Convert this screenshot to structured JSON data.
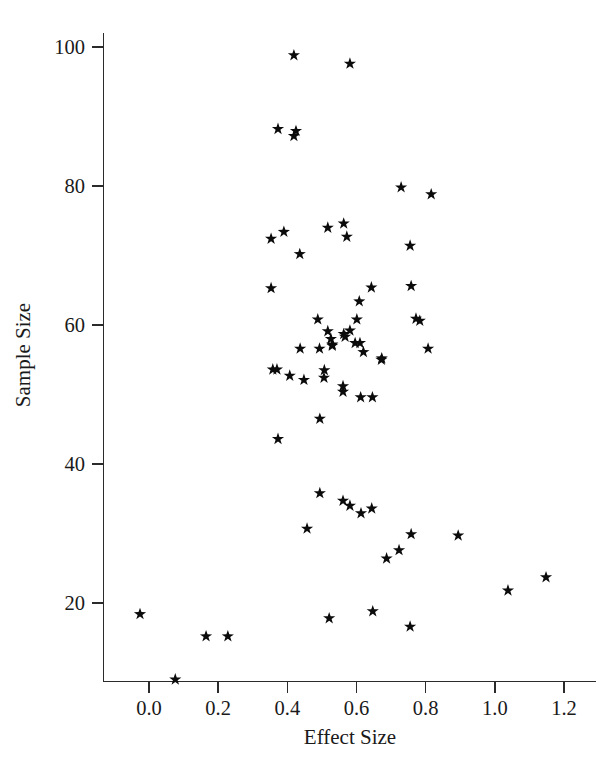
{
  "chart_data": {
    "type": "scatter",
    "title": "",
    "xlabel": "Effect Size",
    "ylabel": "Sample Size",
    "xlim": [
      -0.12,
      1.28
    ],
    "ylim": [
      5,
      104
    ],
    "grid": false,
    "legend": "none",
    "marker": "star",
    "marker_color": "#0b0b0b",
    "xticks": [
      "0.0",
      "0.2",
      "0.4",
      "0.6",
      "0.8",
      "1.0",
      "1.2"
    ],
    "xtick_values": [
      0.0,
      0.2,
      0.4,
      0.6,
      0.8,
      1.0,
      1.2
    ],
    "yticks": [
      "20",
      "40",
      "60",
      "80",
      "100"
    ],
    "ytick_values": [
      20,
      40,
      60,
      80,
      100
    ],
    "n_points": 68,
    "points": [
      [
        0.419,
        98.8
      ],
      [
        0.581,
        97.6
      ],
      [
        0.373,
        88.2
      ],
      [
        0.425,
        87.9
      ],
      [
        0.419,
        87.2
      ],
      [
        0.729,
        79.8
      ],
      [
        0.816,
        78.8
      ],
      [
        0.563,
        74.6
      ],
      [
        0.517,
        74.0
      ],
      [
        0.39,
        73.4
      ],
      [
        0.572,
        72.7
      ],
      [
        0.755,
        71.4
      ],
      [
        0.353,
        72.4
      ],
      [
        0.436,
        70.2
      ],
      [
        0.758,
        65.6
      ],
      [
        0.353,
        65.3
      ],
      [
        0.643,
        65.4
      ],
      [
        0.608,
        63.4
      ],
      [
        0.601,
        60.8
      ],
      [
        0.488,
        60.8
      ],
      [
        0.772,
        60.9
      ],
      [
        0.783,
        60.6
      ],
      [
        0.517,
        59.1
      ],
      [
        0.563,
        58.7
      ],
      [
        0.807,
        56.6
      ],
      [
        0.596,
        57.4
      ],
      [
        0.53,
        57.2
      ],
      [
        0.62,
        56.1
      ],
      [
        0.672,
        55.0
      ],
      [
        0.37,
        53.6
      ],
      [
        0.358,
        53.6
      ],
      [
        0.407,
        52.7
      ],
      [
        0.506,
        52.4
      ],
      [
        0.561,
        50.4
      ],
      [
        0.646,
        49.6
      ],
      [
        0.494,
        46.5
      ],
      [
        0.373,
        43.6
      ],
      [
        0.494,
        35.8
      ],
      [
        0.561,
        34.7
      ],
      [
        0.581,
        34.0
      ],
      [
        0.644,
        33.6
      ],
      [
        0.613,
        32.9
      ],
      [
        0.457,
        30.7
      ],
      [
        0.758,
        29.9
      ],
      [
        0.894,
        29.7
      ],
      [
        0.723,
        27.6
      ],
      [
        0.687,
        26.4
      ],
      [
        1.148,
        23.7
      ],
      [
        1.038,
        21.8
      ],
      [
        0.647,
        18.8
      ],
      [
        0.521,
        17.8
      ],
      [
        0.755,
        16.6
      ],
      [
        -0.026,
        18.4
      ],
      [
        0.165,
        15.2
      ],
      [
        0.228,
        15.2
      ],
      [
        0.076,
        9.0
      ],
      [
        0.448,
        52.1
      ],
      [
        0.526,
        58.0
      ],
      [
        0.53,
        57.0
      ],
      [
        0.567,
        58.3
      ],
      [
        0.581,
        59.2
      ],
      [
        0.61,
        57.4
      ],
      [
        0.612,
        49.6
      ],
      [
        0.493,
        56.6
      ],
      [
        0.437,
        56.6
      ],
      [
        0.507,
        53.5
      ],
      [
        0.561,
        51.2
      ],
      [
        0.673,
        55.2
      ]
    ]
  },
  "axes": {
    "x_axis_name": "effect-size-axis",
    "y_axis_name": "sample-size-axis"
  }
}
